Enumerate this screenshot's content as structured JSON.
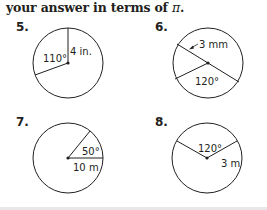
{
  "header": {
    "text_prefix": "your answer in terms of ",
    "pi_symbol": "π",
    "text_suffix": "."
  },
  "problems": [
    {
      "number": "5.",
      "radius_label": "4 in.",
      "angle_label": "110°",
      "description": "Circle with vertical radius of 4 in. and a central angle of 110° on the left"
    },
    {
      "number": "6.",
      "radius_label": "3 mm",
      "angle_label": "120°",
      "description": "Circle with diameter line and a radius forming 120° angle at bottom, radius 3 mm"
    },
    {
      "number": "7.",
      "radius_label": "10 m",
      "angle_label": "50°",
      "description": "Circle with horizontal radius of 10 m and a 50° central angle above it"
    },
    {
      "number": "8.",
      "radius_label": "3 m",
      "angle_label": "120°",
      "description": "Circle with two radii forming a 120° central angle at the top, radius 3 m"
    }
  ],
  "colors": {
    "ink": "#231f20",
    "background": "#ffffff",
    "bottom_bar": "#e8e8e8"
  }
}
